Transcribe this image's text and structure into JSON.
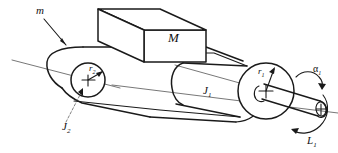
{
  "figure": {
    "background_color": "#ffffff",
    "line_color": "#1a1a1a",
    "width": 338,
    "height": 153
  },
  "labels": {
    "belt_mass": {
      "text": "m",
      "meaning": "belt-mass-label",
      "x": 36,
      "y": 14
    },
    "block_mass": {
      "text": "M",
      "meaning": "block-mass-label",
      "x": 168,
      "y": 42
    },
    "inertia_driver": {
      "text": "J",
      "subscript": "1",
      "meaning": "driver-pulley-inertia-label",
      "x": 203,
      "y": 94
    },
    "inertia_driven": {
      "text": "J",
      "subscript": "2",
      "meaning": "driven-pulley-inertia-label",
      "x": 62,
      "y": 130
    },
    "radius_large": {
      "text": "r",
      "subscript": "1",
      "meaning": "large-pulley-radius-label",
      "x": 258,
      "y": 74
    },
    "radius_small": {
      "text": "r",
      "subscript": "2",
      "meaning": "small-pulley-radius-label",
      "x": 89,
      "y": 71
    },
    "angular_accel": {
      "text": "α",
      "subscript": "1",
      "meaning": "angular-acceleration-label",
      "x": 313,
      "y": 72
    },
    "torque": {
      "text": "L",
      "subscript": "1",
      "meaning": "applied-torque-label",
      "x": 307,
      "y": 144
    }
  },
  "components": [
    {
      "name": "belt-loop",
      "description": "Closed belt wrapping both pulleys"
    },
    {
      "name": "block-M",
      "description": "Rectangular block of mass M resting on belt"
    },
    {
      "name": "driven-pulley-J2",
      "description": "Small left pulley of radius r2, inertia J2"
    },
    {
      "name": "driver-pulley-J1",
      "description": "Large right pulley of radius r1, inertia J1"
    },
    {
      "name": "drive-shaft",
      "description": "Input shaft at right carrying torque L1"
    },
    {
      "name": "center-axis",
      "description": "Thin construction axis line through pulley centres"
    }
  ]
}
